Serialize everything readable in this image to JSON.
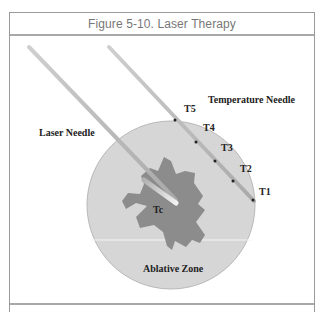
{
  "figure": {
    "title": "Figure 5-10. Laser Therapy",
    "labels": {
      "laser_needle": "Laser Needle",
      "temperature_needle": "Temperature Needle",
      "tc": "Tc",
      "ablative_zone": "Ablative Zone"
    },
    "sensors": [
      {
        "id": "T1",
        "label": "T1"
      },
      {
        "id": "T2",
        "label": "T2"
      },
      {
        "id": "T3",
        "label": "T3"
      },
      {
        "id": "T4",
        "label": "T4"
      },
      {
        "id": "T5",
        "label": "T5"
      }
    ],
    "colors": {
      "ablative_zone": "#d6d6d6",
      "tumor": "#8c8c8c",
      "needle": "#bdbdbd",
      "frame": "#9a9a9a",
      "title": "#777777"
    }
  }
}
